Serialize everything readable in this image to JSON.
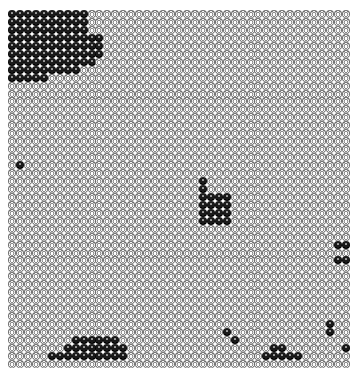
{
  "board": {
    "cols": 43,
    "rows": 45,
    "pitch": 7.95,
    "colors": {
      "background": "#ffffff",
      "black": "#111111",
      "white": "#eeeeee",
      "outline": "#777777"
    },
    "black_runs": [
      {
        "row": 0,
        "from": 0,
        "to": 9
      },
      {
        "row": 1,
        "from": 0,
        "to": 9
      },
      {
        "row": 2,
        "from": 0,
        "to": 9
      },
      {
        "row": 3,
        "from": 0,
        "to": 11
      },
      {
        "row": 4,
        "from": 0,
        "to": 11
      },
      {
        "row": 5,
        "from": 0,
        "to": 11
      },
      {
        "row": 6,
        "from": 0,
        "to": 10
      },
      {
        "row": 7,
        "from": 0,
        "to": 8
      },
      {
        "row": 8,
        "from": 0,
        "to": 4
      },
      {
        "row": 19,
        "from": 1,
        "to": 1
      },
      {
        "row": 21,
        "from": 24,
        "to": 24
      },
      {
        "row": 22,
        "from": 24,
        "to": 24
      },
      {
        "row": 23,
        "from": 24,
        "to": 27
      },
      {
        "row": 24,
        "from": 24,
        "to": 27
      },
      {
        "row": 25,
        "from": 24,
        "to": 27
      },
      {
        "row": 26,
        "from": 24,
        "to": 27
      },
      {
        "row": 29,
        "from": 41,
        "to": 42
      },
      {
        "row": 31,
        "from": 41,
        "to": 42
      },
      {
        "row": 39,
        "from": 40,
        "to": 40
      },
      {
        "row": 40,
        "from": 27,
        "to": 27
      },
      {
        "row": 40,
        "from": 40,
        "to": 40
      },
      {
        "row": 41,
        "from": 28,
        "to": 28
      },
      {
        "row": 41,
        "from": 8,
        "to": 13
      },
      {
        "row": 42,
        "from": 7,
        "to": 14
      },
      {
        "row": 42,
        "from": 33,
        "to": 34
      },
      {
        "row": 42,
        "from": 42,
        "to": 42
      },
      {
        "row": 43,
        "from": 5,
        "to": 14
      },
      {
        "row": 43,
        "from": 32,
        "to": 36
      }
    ]
  }
}
